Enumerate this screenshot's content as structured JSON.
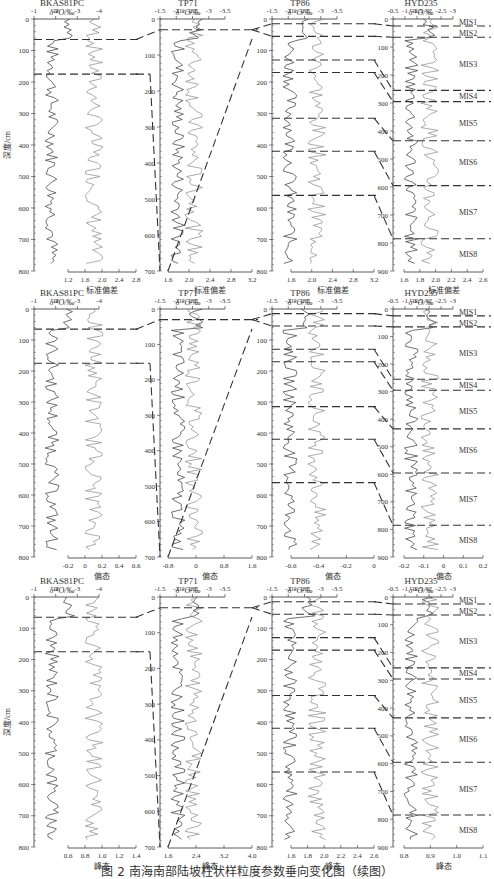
{
  "figure": {
    "caption": "图 2  南海南部陆坡柱状样粒度参数垂向变化图（续图）",
    "depth_axis_label": "深度/cm",
    "isotope_axis_label": "δ¹⁸O/‰",
    "boundary_style": "dashed"
  },
  "chart_data": {
    "type": "line",
    "title": "南海南部陆坡柱状样粒度参数垂向变化图（续图）",
    "layout": {
      "rows": 3,
      "cols": 4,
      "grid": false,
      "legend": "none",
      "y_inverted": true
    },
    "cores": [
      {
        "name": "BKAS81PC",
        "depth_range": [
          0,
          800
        ],
        "depth_ticks": [
          0,
          100,
          200,
          300,
          400,
          500,
          600,
          700,
          800
        ],
        "d18o_ticks": [
          "-1",
          "-2",
          "-3",
          "-4"
        ],
        "d18o_range": [
          -1,
          -4
        ],
        "mis_boundaries_cm": [
          65,
          175
        ]
      },
      {
        "name": "TP71",
        "depth_range": [
          0,
          700
        ],
        "depth_ticks": [
          0,
          100,
          200,
          300,
          400,
          500,
          600,
          700
        ],
        "d18o_ticks": [
          "-1.5",
          "-2",
          "-2.5",
          "-3",
          "-3.5"
        ],
        "d18o_range": [
          -1.5,
          -3.5
        ],
        "mis_boundaries_cm": [
          30
        ]
      },
      {
        "name": "TP86",
        "depth_range": [
          0,
          800
        ],
        "depth_ticks": [
          0,
          100,
          200,
          300,
          400,
          500,
          600,
          700,
          800
        ],
        "d18o_ticks": [
          "-1.5",
          "-2",
          "-2.5",
          "-3",
          "-3.5"
        ],
        "d18o_range": [
          -1.5,
          -3.5
        ],
        "mis_boundaries_cm": [
          15,
          55,
          130,
          170,
          315,
          420,
          560
        ]
      },
      {
        "name": "HYD235",
        "depth_range": [
          0,
          900
        ],
        "depth_ticks": [
          0,
          100,
          200,
          300,
          400,
          500,
          600,
          700,
          800,
          900
        ],
        "d18o_ticks": [
          "-0.5",
          "-1",
          "-1.5",
          "-2",
          "-2.5",
          "-3"
        ],
        "d18o_range": [
          -0.5,
          -3
        ],
        "mis_boundaries_cm": [
          25,
          65,
          255,
          295,
          435,
          595,
          785
        ],
        "mis_labels": [
          {
            "label": "MIS1",
            "depth": 10
          },
          {
            "label": "MIS2",
            "depth": 50
          },
          {
            "label": "MIS3",
            "depth": 160
          },
          {
            "label": "MIS4",
            "depth": 275
          },
          {
            "label": "MIS5",
            "depth": 370
          },
          {
            "label": "MIS6",
            "depth": 510
          },
          {
            "label": "MIS7",
            "depth": 690
          },
          {
            "label": "MIS8",
            "depth": 840
          }
        ]
      }
    ],
    "rows": [
      {
        "parameter": "标准偏差",
        "xlabel": "标准偏差",
        "x_axes": [
          {
            "ticks": [
              "1.2",
              "1.6",
              "2.0",
              "2.4",
              "2.8"
            ],
            "range": [
              1.2,
              2.8
            ]
          },
          {
            "ticks": [
              "1.6",
              "2.0",
              "2.4",
              "2.8",
              "3.2"
            ],
            "range": [
              1.6,
              3.2
            ]
          },
          {
            "ticks": [
              "1.6",
              "2.0",
              "2.4",
              "2.8",
              "3.2"
            ],
            "range": [
              1.6,
              3.2
            ]
          },
          {
            "ticks": [
              "1.6",
              "1.8",
              "2.0",
              "2.2",
              "2.4",
              "2.6"
            ],
            "range": [
              1.6,
              2.6
            ]
          }
        ]
      },
      {
        "parameter": "偏态",
        "xlabel": "偏态",
        "x_axes": [
          {
            "ticks": [
              "-0.2",
              "0",
              "0.2",
              "0.4",
              "0.6"
            ],
            "range": [
              -0.2,
              0.6
            ]
          },
          {
            "ticks": [
              "-0.8",
              "0",
              "0.8",
              "1.6"
            ],
            "range": [
              -0.8,
              1.6
            ]
          },
          {
            "ticks": [
              "-0.6",
              "-0.4",
              "-0.2",
              "0"
            ],
            "range": [
              -0.6,
              0
            ]
          },
          {
            "ticks": [
              "-0.2",
              "-0.1",
              "0",
              "0.1",
              "0.2"
            ],
            "range": [
              -0.2,
              0.2
            ]
          }
        ]
      },
      {
        "parameter": "峰态",
        "xlabel": "峰态",
        "x_axes": [
          {
            "ticks": [
              "0.6",
              "0.8",
              "1.0",
              "1.2",
              "1.4"
            ],
            "range": [
              0.6,
              1.4
            ]
          },
          {
            "ticks": [
              "1.6",
              "2.4",
              "3.2",
              "4.0"
            ],
            "range": [
              1.6,
              4.0
            ]
          },
          {
            "ticks": [
              "1.6",
              "1.8",
              "2.0",
              "2.2",
              "2.4",
              "2.6"
            ],
            "range": [
              1.6,
              2.6
            ]
          },
          {
            "ticks": [
              "0.8",
              "0.9",
              "1.0",
              "1.1"
            ],
            "range": [
              0.8,
              1.1
            ]
          }
        ]
      }
    ],
    "series": [
      {
        "name": "δ18O",
        "color": "#333333",
        "axis": "top"
      },
      {
        "name": "grain-size parameter",
        "color": "#888888",
        "axis": "bottom"
      }
    ]
  }
}
